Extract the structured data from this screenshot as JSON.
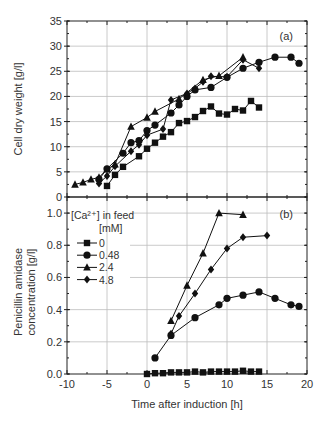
{
  "chart_data": [
    {
      "type": "line",
      "panel_label": "(a)",
      "title": "",
      "xlabel": "",
      "ylabel": "Cell dry weight [g/l]",
      "xlim": [
        -10,
        20
      ],
      "ylim": [
        0,
        35
      ],
      "yticks": [
        0,
        5,
        10,
        15,
        20,
        25,
        30,
        35
      ],
      "ytick_labels": [
        "0",
        "5",
        "10",
        "15",
        "20",
        "25",
        "30",
        "35"
      ],
      "grid": true,
      "series": [
        {
          "name": "0",
          "marker": "square",
          "x": [
            -5,
            -4,
            -3,
            -1,
            0,
            1,
            2,
            3,
            4,
            5,
            6,
            7,
            8,
            9,
            10,
            11,
            12,
            13,
            14
          ],
          "y": [
            2.2,
            4.4,
            6.0,
            8.1,
            9.6,
            10.8,
            12.0,
            12.9,
            14.7,
            15.1,
            15.9,
            17.1,
            18.0,
            16.6,
            16.4,
            17.5,
            17.2,
            19.1,
            17.8
          ]
        },
        {
          "name": "0.48",
          "marker": "circle",
          "x": [
            -6,
            -5,
            -3,
            -2,
            -1,
            0,
            1,
            3,
            4,
            5,
            6,
            8,
            10,
            12,
            14,
            16,
            18,
            19
          ],
          "y": [
            3.5,
            5.6,
            8.7,
            10.8,
            11.2,
            13.2,
            14.3,
            16.7,
            18.3,
            20.0,
            21.3,
            21.8,
            23.8,
            25.6,
            26.8,
            27.8,
            27.8,
            26.6
          ]
        },
        {
          "name": "2.4",
          "marker": "triangle",
          "x": [
            -9,
            -8,
            -7,
            -6,
            -5,
            -4,
            -2,
            0,
            1,
            4,
            7,
            9,
            12
          ],
          "y": [
            2.5,
            2.9,
            3.5,
            3.9,
            5.5,
            6.5,
            14.0,
            15.8,
            17.0,
            19.5,
            23.3,
            24.1,
            27.8
          ]
        },
        {
          "name": "4.8",
          "marker": "diamond",
          "x": [
            -6,
            -5,
            -4,
            -2,
            -1,
            0,
            2,
            3,
            5,
            6,
            7,
            8,
            10,
            12,
            14
          ],
          "y": [
            2.7,
            4.2,
            6.1,
            9.1,
            10.4,
            12.3,
            13.5,
            19.3,
            20.6,
            21.6,
            22.9,
            24.0,
            23.9,
            27.3,
            25.6
          ]
        }
      ]
    },
    {
      "type": "line",
      "panel_label": "(b)",
      "title": "",
      "xlabel": "Time after induction [h]",
      "ylabel": "Penicillin amidase concentration [g/l]",
      "ylabel_lines": [
        "Penicillin amidase",
        "concentration [g/l]"
      ],
      "xlim": [
        -10,
        20
      ],
      "ylim": [
        0,
        1.1
      ],
      "xticks": [
        -10,
        -5,
        0,
        5,
        10,
        15,
        20
      ],
      "xtick_labels": [
        "-10",
        "-5",
        "0",
        "5",
        "10",
        "15",
        "20"
      ],
      "yticks": [
        0,
        0.2,
        0.4,
        0.6,
        0.8,
        1.0
      ],
      "ytick_labels": [
        "0.0",
        "0.2",
        "0.4",
        "0.6",
        "0.8",
        "1.0"
      ],
      "grid": true,
      "legend": {
        "title_line1": "[Ca²⁺] in feed",
        "title_line2": "[mM]",
        "position": "upper left",
        "entries": [
          "0",
          "0.48",
          "2.4",
          "4.8"
        ]
      },
      "series": [
        {
          "name": "0",
          "marker": "square",
          "x": [
            0,
            1,
            2,
            3,
            4,
            5,
            6,
            7,
            8,
            9,
            10,
            11,
            12,
            13,
            14
          ],
          "y": [
            0.0,
            0.005,
            0.005,
            0.01,
            0.01,
            0.01,
            0.015,
            0.01,
            0.015,
            0.015,
            0.015,
            0.015,
            0.02,
            0.015,
            0.015
          ]
        },
        {
          "name": "0.48",
          "marker": "circle",
          "x": [
            1,
            3,
            6,
            9,
            10,
            12,
            14,
            16,
            18,
            19
          ],
          "y": [
            0.1,
            0.24,
            0.35,
            0.43,
            0.47,
            0.49,
            0.51,
            0.47,
            0.43,
            0.42
          ]
        },
        {
          "name": "2.4",
          "marker": "triangle",
          "x": [
            3,
            5,
            7,
            9,
            12
          ],
          "y": [
            0.33,
            0.55,
            0.75,
            1.0,
            0.99
          ]
        },
        {
          "name": "4.8",
          "marker": "diamond",
          "x": [
            3,
            4,
            6,
            8,
            10,
            12,
            15
          ],
          "y": [
            0.25,
            0.36,
            0.5,
            0.65,
            0.78,
            0.85,
            0.86
          ]
        }
      ]
    }
  ]
}
